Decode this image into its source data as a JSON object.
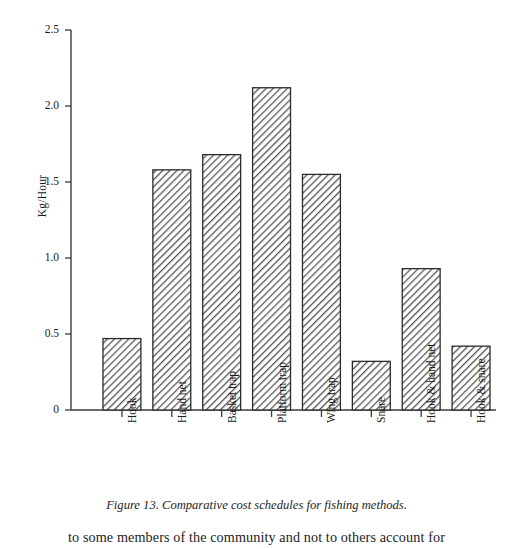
{
  "chart_data": {
    "type": "bar",
    "title": "",
    "xlabel": "",
    "ylabel": "Kg/Hour",
    "ylim": [
      0,
      2.5
    ],
    "ytick_labels": [
      "0",
      "0.5",
      "1.0",
      "1.5",
      "2.0",
      "2.5"
    ],
    "ytick_values": [
      0,
      0.5,
      1.0,
      1.5,
      2.0,
      2.5
    ],
    "grid": false,
    "legend": "none",
    "bar_style": "diagonal-hatch",
    "categories": [
      "Hook",
      "Hand net",
      "Basket trap",
      "Platform trap",
      "Wing trap",
      "Snare",
      "Hook & hand net",
      "Hook & snare"
    ],
    "values": [
      0.47,
      1.58,
      1.68,
      2.12,
      1.55,
      0.32,
      0.93,
      0.42
    ]
  },
  "caption": {
    "text": "Figure 13. Comparative cost schedules for fishing methods."
  },
  "body": {
    "paragraph_line": "to some members of the community and not to others account for"
  },
  "colors": {
    "axis": "#3a3a3a",
    "bar_outline": "#2b2b2b",
    "bar_hatch": "#4a4a4a",
    "text": "#1a1a1a"
  }
}
